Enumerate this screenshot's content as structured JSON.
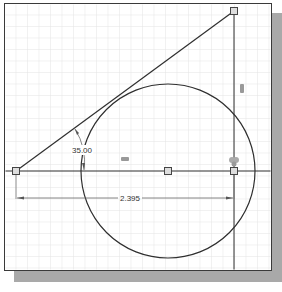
{
  "drawing": {
    "dimensions": {
      "angle_label": "35.00",
      "length_label": "2.395"
    },
    "constraints": {
      "tangent_glyph": "tangent-constraint",
      "vertical_glyph": "vertical-constraint",
      "coincident_glyph": "coincident-constraint",
      "horizontal_glyph": "horizontal-constraint"
    },
    "colors": {
      "line": "#2f2f2f",
      "grid": "#e2e2e2",
      "dimension": "#555555",
      "shadow": "#a9a9a9"
    }
  }
}
